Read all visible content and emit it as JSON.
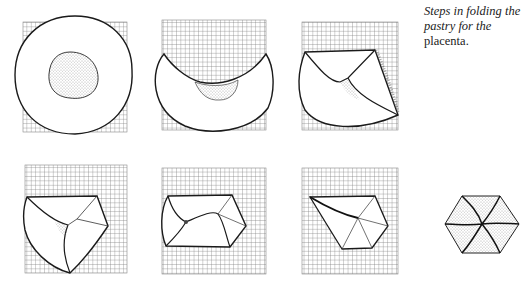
{
  "caption": {
    "italic_part_1": "Steps in folding the",
    "italic_part_2": "pastry for the",
    "roman_part": "placenta."
  },
  "figure": {
    "type": "step-by-step illustration",
    "steps": [
      {
        "index": 1,
        "description": "Round pastry sheet on a cloth with filling mound in center"
      },
      {
        "index": 2,
        "description": "Top of pastry folded down over filling"
      },
      {
        "index": 3,
        "description": "Right side folded in"
      },
      {
        "index": 4,
        "description": "Third fold overlapping from lower left"
      },
      {
        "index": 5,
        "description": "Further folds forming a hexagonal packet"
      },
      {
        "index": 6,
        "description": "Final fold, packet nearly hexagonal"
      },
      {
        "index": 7,
        "description": "Finished hexagonal placenta"
      }
    ],
    "colors": {
      "ink": "#1a1a1a",
      "grid": "#8a8a8a",
      "background": "#ffffff"
    }
  }
}
